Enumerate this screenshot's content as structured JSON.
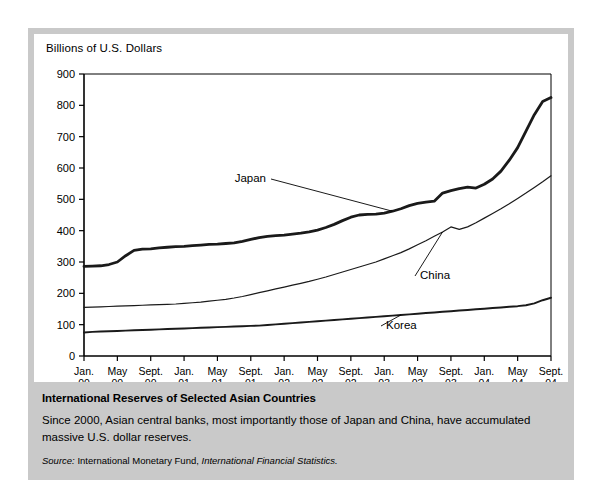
{
  "figure": {
    "axis_title": "Billions of U.S. Dollars",
    "caption_title": "International Reserves of Selected Asian Countries",
    "caption_body": "Since 2000, Asian central banks, most importantly those of Japan and China, have accumulated massive U.S. dollar reserves.",
    "source_label": "Source:",
    "source_text": "International Monetary Fund,",
    "source_publication": "International Financial Statistics."
  },
  "chart_data": {
    "type": "line",
    "title": "International Reserves of Selected Asian Countries",
    "xlabel": "",
    "ylabel": "Billions of U.S. Dollars",
    "ylim": [
      0,
      900
    ],
    "yticks": [
      0,
      100,
      200,
      300,
      400,
      500,
      600,
      700,
      800,
      900
    ],
    "grid": false,
    "legend": "inline-annotations",
    "xtick_labels": [
      {
        "month": "Jan.",
        "year": "00"
      },
      {
        "month": "May",
        "year": "00"
      },
      {
        "month": "Sept.",
        "year": "00"
      },
      {
        "month": "Jan.",
        "year": "01"
      },
      {
        "month": "May",
        "year": "01"
      },
      {
        "month": "Sept.",
        "year": "01"
      },
      {
        "month": "Jan.",
        "year": "02"
      },
      {
        "month": "May",
        "year": "02"
      },
      {
        "month": "Sept.",
        "year": "02"
      },
      {
        "month": "Jan.",
        "year": "03"
      },
      {
        "month": "May",
        "year": "03"
      },
      {
        "month": "Sept.",
        "year": "03"
      },
      {
        "month": "Jan.",
        "year": "04"
      },
      {
        "month": "May",
        "year": "04"
      },
      {
        "month": "Sept.",
        "year": "04"
      }
    ],
    "x": [
      0,
      1,
      2,
      3,
      4,
      5,
      6,
      7,
      8,
      9,
      10,
      11,
      12,
      13,
      14,
      15,
      16,
      17,
      18,
      19,
      20,
      21,
      22,
      23,
      24,
      25,
      26,
      27,
      28,
      29,
      30,
      31,
      32,
      33,
      34,
      35,
      36,
      37,
      38,
      39,
      40,
      41,
      42,
      43,
      44,
      45,
      46,
      47,
      48,
      49,
      50,
      51,
      52,
      53,
      54,
      55,
      56
    ],
    "series": [
      {
        "name": "Japan",
        "label": "Japan",
        "linewidth": "thick",
        "values": [
          286,
          287,
          288,
          292,
          300,
          320,
          337,
          341,
          342,
          345,
          347,
          349,
          350,
          352,
          354,
          356,
          357,
          359,
          361,
          366,
          372,
          378,
          382,
          384,
          386,
          389,
          392,
          396,
          402,
          410,
          420,
          432,
          443,
          450,
          452,
          453,
          456,
          462,
          470,
          480,
          487,
          491,
          494,
          520,
          528,
          534,
          539,
          536,
          548,
          565,
          590,
          625,
          665,
          718,
          770,
          812,
          825
        ]
      },
      {
        "name": "China",
        "label": "China",
        "linewidth": "thin",
        "values": [
          155,
          156,
          157,
          158,
          159,
          160,
          161,
          162,
          163,
          164,
          165,
          166,
          168,
          170,
          172,
          175,
          178,
          181,
          185,
          190,
          196,
          202,
          208,
          214,
          220,
          226,
          232,
          238,
          245,
          252,
          260,
          268,
          276,
          284,
          292,
          300,
          310,
          320,
          330,
          342,
          355,
          368,
          382,
          396,
          412,
          404,
          412,
          425,
          440,
          455,
          470,
          486,
          503,
          520,
          538,
          556,
          575
        ]
      },
      {
        "name": "Korea",
        "label": "Korea",
        "linewidth": "medium",
        "values": [
          75,
          77,
          78,
          79,
          80,
          81,
          82,
          83,
          84,
          85,
          86,
          87,
          88,
          89,
          90,
          91,
          92,
          93,
          94,
          95,
          96,
          97,
          99,
          101,
          103,
          105,
          107,
          109,
          111,
          113,
          115,
          117,
          119,
          121,
          123,
          125,
          127,
          129,
          131,
          133,
          135,
          137,
          139,
          141,
          143,
          145,
          147,
          149,
          151,
          153,
          155,
          157,
          159,
          162,
          168,
          178,
          186
        ]
      }
    ],
    "annotations": [
      {
        "text": "Japan",
        "series": "Japan"
      },
      {
        "text": "China",
        "series": "China"
      },
      {
        "text": "Korea",
        "series": "Korea"
      }
    ]
  }
}
